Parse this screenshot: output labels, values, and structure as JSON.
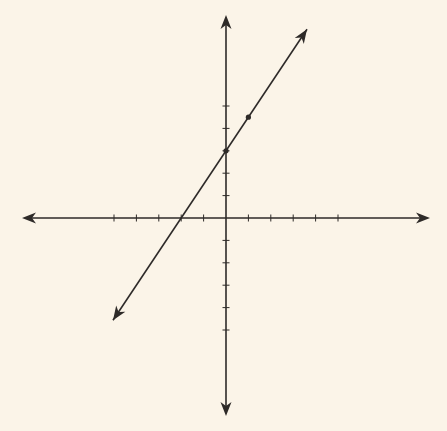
{
  "chart_data": {
    "type": "line",
    "title": "",
    "xlabel": "",
    "ylabel": "",
    "equation": "y = 1.5x + 3",
    "slope": 1.5,
    "y_intercept": 3,
    "x_intercept": -2,
    "points": [
      {
        "x": 0,
        "y": 3
      },
      {
        "x": 1,
        "y": 4.5
      }
    ],
    "xlim": [
      -9,
      9
    ],
    "ylim": [
      -9,
      9
    ],
    "x_ticks": [
      -5,
      -4,
      -3,
      -2,
      -1,
      1,
      2,
      3,
      4,
      5
    ],
    "y_ticks": [
      -5,
      -4,
      -3,
      -2,
      -1,
      1,
      2,
      3,
      4,
      5
    ],
    "tick_labels": false,
    "grid": false,
    "legend": null
  },
  "colors": {
    "background": "#fbf4e8",
    "ink": "#2e2a28"
  },
  "layout": {
    "origin_px": [
      226,
      218
    ],
    "unit_px": 22.4
  }
}
